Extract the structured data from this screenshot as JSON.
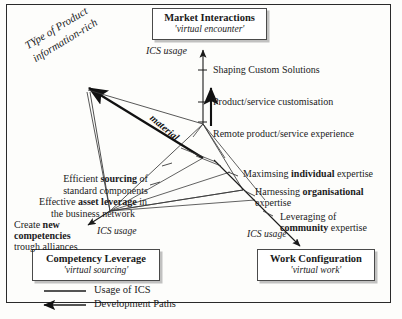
{
  "figure": {
    "nodes": [
      {
        "id": "market",
        "title": "Market Interactions",
        "subtitle": "'virtual encounter'"
      },
      {
        "id": "competency",
        "title": "Competency Leverage",
        "subtitle": "'virtual sourcing'"
      },
      {
        "id": "work",
        "title": "Work Configuration",
        "subtitle": "'virtual work'"
      }
    ],
    "axis_labels": {
      "top": "ICS usage",
      "left": "ICS usage",
      "right": "ICS usage"
    },
    "rotated_axis": {
      "line1": "TYpe of Product",
      "line2": "information-rich"
    },
    "diagonal_label": "material",
    "market_items": [
      "Shaping Custom Solutions",
      "Product/service customisation",
      "Remote product/service experience"
    ],
    "competency_items": [
      {
        "pre": "Efficient ",
        "bold": "sourcing",
        "post": " of",
        "line2": "standard components"
      },
      {
        "pre": "Effective ",
        "bold": "asset leverage",
        "post": " in",
        "line2": "the business network"
      },
      {
        "pre": "Create ",
        "bold": "new",
        "post": "",
        "line2b": "competencies",
        "line3": "trough alliances"
      }
    ],
    "work_items": [
      {
        "pre": "Maximsing ",
        "bold": "individual",
        "post": " expertise"
      },
      {
        "pre": "Harnessing ",
        "bold": "organisational",
        "post": "",
        "line2": "expertise"
      },
      {
        "pre": "Leveraging of",
        "bold": "community",
        "post": " expertise"
      }
    ],
    "legend": [
      {
        "key": "solid-line",
        "label": "Usage of ICS"
      },
      {
        "key": "arrow-line",
        "label": "Development Paths"
      }
    ]
  }
}
